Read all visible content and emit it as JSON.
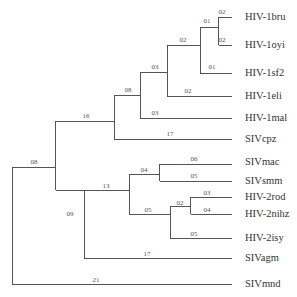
{
  "tree": {
    "line_color": "#555555",
    "leaves": [
      {
        "name": "HIV-1bru",
        "y": 17
      },
      {
        "name": "HIV-1oyi",
        "y": 45
      },
      {
        "name": "HIV-1sf2",
        "y": 73
      },
      {
        "name": "HIV-1eli",
        "y": 96
      },
      {
        "name": "HIV-1mal",
        "y": 118
      },
      {
        "name": "SIVcpz",
        "y": 139
      },
      {
        "name": "SIVmac",
        "y": 160
      },
      {
        "name": "SIVsmm",
        "y": 181
      },
      {
        "name": "HIV-2rod",
        "y": 197
      },
      {
        "name": "HIV-2nihz",
        "y": 214
      },
      {
        "name": "HIV-2isy",
        "y": 238
      },
      {
        "name": "SIVagm",
        "y": 258
      },
      {
        "name": "SIVmnd",
        "y": 284
      }
    ],
    "branch_labels": [
      {
        "text": "02",
        "x": 222,
        "y": 8
      },
      {
        "text": "01",
        "x": 207,
        "y": 22
      },
      {
        "text": "02",
        "x": 222,
        "y": 36
      },
      {
        "text": "02",
        "x": 183,
        "y": 36
      },
      {
        "text": "01",
        "x": 220,
        "y": 64
      },
      {
        "text": "03",
        "x": 155,
        "y": 63
      },
      {
        "text": "02",
        "x": 188,
        "y": 87
      },
      {
        "text": "08",
        "x": 128,
        "y": 86
      },
      {
        "text": "03",
        "x": 155,
        "y": 109
      },
      {
        "text": "16",
        "x": 86,
        "y": 112
      },
      {
        "text": "17",
        "x": 170,
        "y": 130
      },
      {
        "text": "08",
        "x": 34,
        "y": 158
      },
      {
        "text": "06",
        "x": 194,
        "y": 151
      },
      {
        "text": "04",
        "x": 144,
        "y": 166
      },
      {
        "text": "05",
        "x": 194,
        "y": 172
      },
      {
        "text": "13",
        "x": 106,
        "y": 180
      },
      {
        "text": "03",
        "x": 207,
        "y": 189
      },
      {
        "text": "02",
        "x": 180,
        "y": 200
      },
      {
        "text": "04",
        "x": 207,
        "y": 206
      },
      {
        "text": "09",
        "x": 70,
        "y": 209
      },
      {
        "text": "05",
        "x": 148,
        "y": 209
      },
      {
        "text": "05",
        "x": 194,
        "y": 230
      },
      {
        "text": "17",
        "x": 147,
        "y": 248
      },
      {
        "text": "21",
        "x": 96,
        "y": 275
      }
    ]
  }
}
